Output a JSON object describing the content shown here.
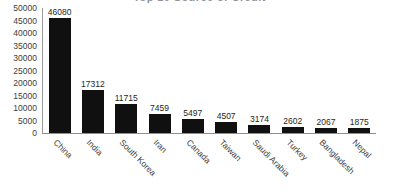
{
  "chart_data": {
    "type": "bar",
    "title": "Top 10 Source of Credit",
    "categories": [
      "China",
      "India",
      "South Korea",
      "Iran",
      "Canada",
      "Taiwan",
      "Saudi Arabia",
      "Turkey",
      "Bangladesh",
      "Nepal"
    ],
    "values": [
      46080,
      17312,
      11715,
      7459,
      5497,
      4507,
      3174,
      2602,
      2067,
      1875
    ],
    "xlabel": "",
    "ylabel": "",
    "ylim": [
      0,
      50000
    ],
    "yticks": [
      50000,
      45000,
      40000,
      35000,
      30000,
      25000,
      20000,
      15000,
      10000,
      5000,
      0
    ],
    "ytick_labels": [
      "50000",
      "45000",
      "40000",
      "35000",
      "30000",
      "25000",
      "20000",
      "15000",
      "10000",
      "5000",
      "0"
    ],
    "grid": false,
    "legend": false,
    "legend_position": "none",
    "bar_color": "#101010",
    "data_labels": [
      "46080",
      "17312",
      "11715",
      "7459",
      "5497",
      "4507",
      "3174",
      "2602",
      "2067",
      "1875"
    ]
  },
  "caption": ""
}
